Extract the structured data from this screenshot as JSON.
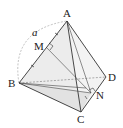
{
  "figure": {
    "type": "tetrahedron",
    "vertices": {
      "A": {
        "label": "A",
        "x": 67,
        "y": 21
      },
      "B": {
        "label": "B",
        "x": 19,
        "y": 83
      },
      "C": {
        "label": "C",
        "x": 81,
        "y": 112
      },
      "D": {
        "label": "D",
        "x": 106,
        "y": 77
      }
    },
    "points": {
      "M": {
        "label": "M",
        "x": 46,
        "y": 47
      },
      "N": {
        "label": "N",
        "x": 91,
        "y": 93
      }
    },
    "edge_label": "a",
    "colors": {
      "line": "#333333",
      "face": "#e6e6e6",
      "dash": "#888888"
    }
  }
}
